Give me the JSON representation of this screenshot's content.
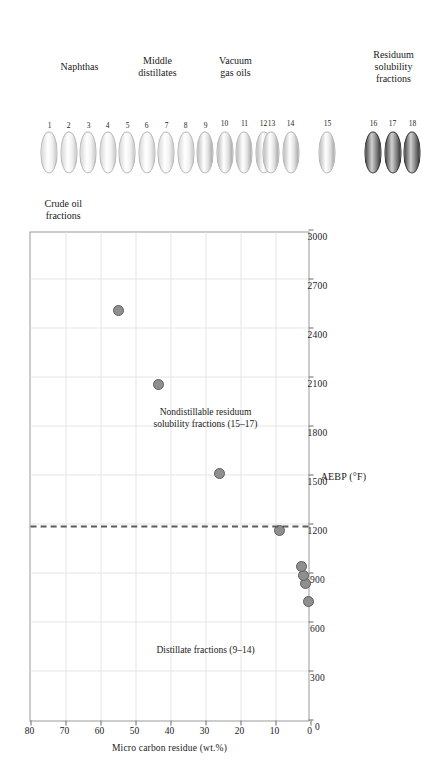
{
  "chart_data": {
    "type": "scatter",
    "title": "",
    "xlabel": "AEBP (°F)",
    "ylabel": "Micro carbon residue (wt.%)",
    "xlim": [
      0,
      3000
    ],
    "ylim": [
      0,
      80
    ],
    "xticks": [
      0,
      300,
      600,
      900,
      1200,
      1500,
      1800,
      2100,
      2400,
      2700,
      3000
    ],
    "yticks": [
      0,
      10,
      20,
      30,
      40,
      50,
      60,
      70,
      80
    ],
    "grid": true,
    "legend_position": "none",
    "points": [
      {
        "fraction": 9,
        "x": 730,
        "y": 0.5
      },
      {
        "fraction": 11,
        "x": 840,
        "y": 1.5
      },
      {
        "fraction": 12,
        "x": 890,
        "y": 2.0
      },
      {
        "fraction": 14,
        "x": 940,
        "y": 2.5
      },
      {
        "fraction": 15,
        "x": 1165,
        "y": 9.0
      },
      {
        "fraction": 16,
        "x": 1510,
        "y": 26.0
      },
      {
        "fraction": 17,
        "x": 2060,
        "y": 43.5
      },
      {
        "fraction": 18,
        "x": 2510,
        "y": 55.0
      }
    ],
    "annotations": [
      {
        "id": "distillate",
        "text_lines": [
          "Distillate fractions (9–14)"
        ],
        "x": 430,
        "y": 30
      },
      {
        "id": "residuum",
        "text_lines": [
          "Nondistillable residuum",
          "solubility fractions (15–17)"
        ],
        "x": 1850,
        "y": 30
      }
    ],
    "divider": {
      "x": 1180,
      "style": "dashed"
    }
  },
  "axes": {
    "x_title": "AEBP (°F)",
    "y_title": "Micro carbon residue (wt.%)",
    "x_tick_labels": [
      "0",
      "300",
      "600",
      "900",
      "1200",
      "1500",
      "1800",
      "2100",
      "2400",
      "2700",
      "3000"
    ],
    "y_tick_labels": [
      "0",
      "10",
      "20",
      "30",
      "40",
      "50",
      "60",
      "70",
      "80"
    ]
  },
  "annotations": {
    "distillate": "Distillate fractions (9–14)",
    "residuum_line1": "Nondistillable residuum",
    "residuum_line2": "solubility fractions (15–17)"
  },
  "legend": {
    "header_line1": "Crude oil",
    "header_line2": "fractions",
    "groups": [
      {
        "id": "naphthas",
        "label_lines": [
          "Naphthas"
        ],
        "numbers": [
          "1",
          "2",
          "3",
          "4"
        ],
        "shade": "light"
      },
      {
        "id": "middle-distillates",
        "label_lines": [
          "Middle",
          "distillates"
        ],
        "numbers": [
          "5",
          "6",
          "7",
          "8"
        ],
        "shade": "light"
      },
      {
        "id": "vacuum-gas-oils",
        "label_lines": [
          "Vacuum",
          "gas oils"
        ],
        "numbers": [
          "9",
          "10",
          "11",
          "12"
        ],
        "shade": "medium"
      },
      {
        "id": "vacuum-gas-oils-b",
        "label_lines": [],
        "numbers": [
          "13",
          "14"
        ],
        "shade": "medium"
      },
      {
        "id": "residuum-15",
        "label_lines": [],
        "numbers": [
          "15"
        ],
        "shade": "medium"
      },
      {
        "id": "residuum-solubility",
        "label_lines": [
          "Residuum",
          "solubility",
          "fractions"
        ],
        "numbers": [
          "16",
          "17",
          "18"
        ],
        "shade": "dark"
      }
    ]
  },
  "colors": {
    "point_fill": "#8f8f8f",
    "point_stroke": "#5e5e5e",
    "grid": "#e6e6e6",
    "frame": "#9a9a9a",
    "divider": "#5b5b5b",
    "text": "#1a1a1a"
  }
}
